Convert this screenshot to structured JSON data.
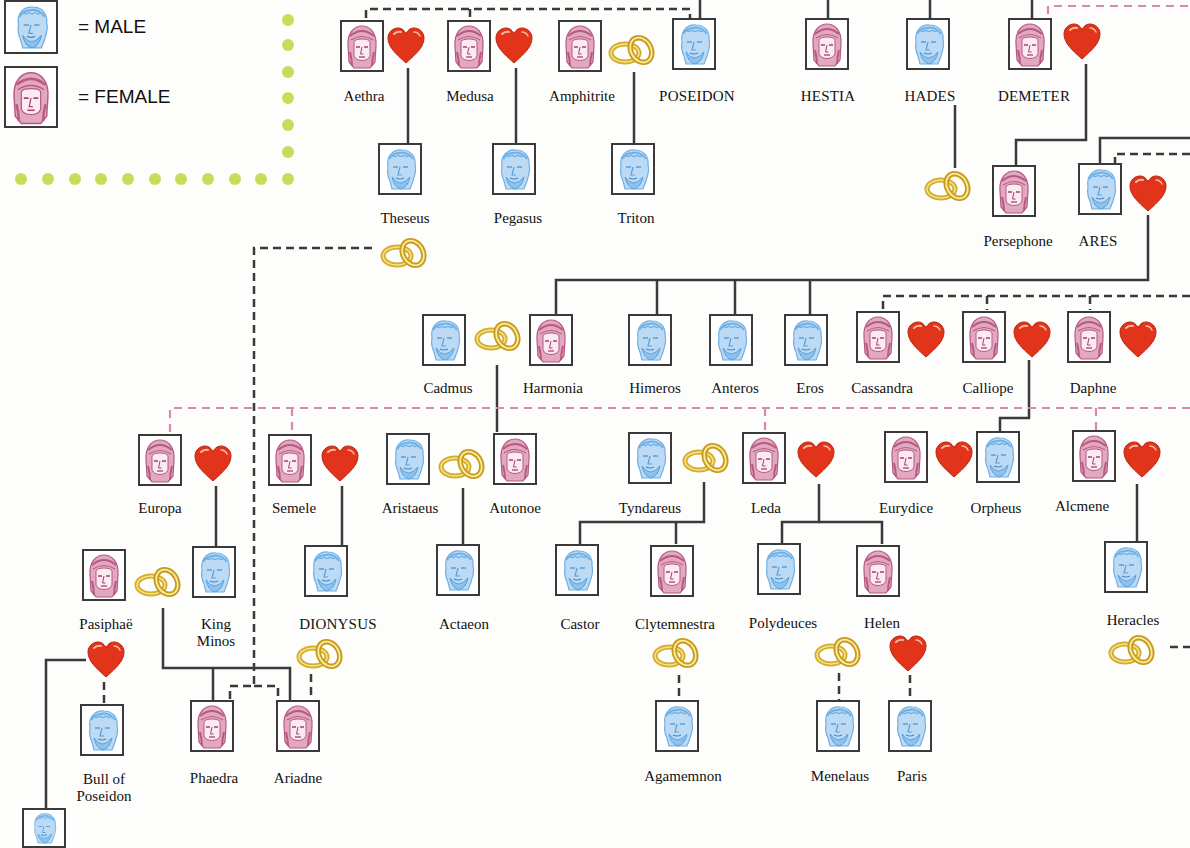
{
  "legend": {
    "male_label": "= MALE",
    "female_label": "= FEMALE",
    "male_color": "#7ab8ea",
    "female_color": "#c0648a",
    "border_color": "#c8dc5a"
  },
  "symbols": {
    "heart": "heart-icon (love affair)",
    "rings": "wedding-rings-icon (marriage)",
    "heart_color": "#e23a1c",
    "ring_color": "#d9b63a"
  },
  "people": [
    {
      "id": "aethra",
      "name": "Aethra",
      "sex": "female"
    },
    {
      "id": "medusa",
      "name": "Medusa",
      "sex": "female"
    },
    {
      "id": "amphitrite",
      "name": "Amphitrite",
      "sex": "female"
    },
    {
      "id": "poseidon",
      "name": "POSEIDON",
      "sex": "male"
    },
    {
      "id": "hestia",
      "name": "HESTIA",
      "sex": "female"
    },
    {
      "id": "hades",
      "name": "HADES",
      "sex": "male"
    },
    {
      "id": "demeter",
      "name": "DEMETER",
      "sex": "female"
    },
    {
      "id": "theseus",
      "name": "Theseus",
      "sex": "male"
    },
    {
      "id": "pegasus",
      "name": "Pegasus",
      "sex": "male"
    },
    {
      "id": "triton",
      "name": "Triton",
      "sex": "male"
    },
    {
      "id": "persephone",
      "name": "Persephone",
      "sex": "female"
    },
    {
      "id": "ares",
      "name": "ARES",
      "sex": "male"
    },
    {
      "id": "cadmus",
      "name": "Cadmus",
      "sex": "male"
    },
    {
      "id": "harmonia",
      "name": "Harmonia",
      "sex": "female"
    },
    {
      "id": "himeros",
      "name": "Himeros",
      "sex": "male"
    },
    {
      "id": "anteros",
      "name": "Anteros",
      "sex": "male"
    },
    {
      "id": "eros",
      "name": "Eros",
      "sex": "male"
    },
    {
      "id": "cassandra",
      "name": "Cassandra",
      "sex": "female"
    },
    {
      "id": "calliope",
      "name": "Calliope",
      "sex": "female"
    },
    {
      "id": "daphne",
      "name": "Daphne",
      "sex": "female"
    },
    {
      "id": "europa",
      "name": "Europa",
      "sex": "female"
    },
    {
      "id": "semele",
      "name": "Semele",
      "sex": "female"
    },
    {
      "id": "aristaeus",
      "name": "Aristaeus",
      "sex": "male"
    },
    {
      "id": "autonoe",
      "name": "Autonoe",
      "sex": "female"
    },
    {
      "id": "tyndareus",
      "name": "Tyndareus",
      "sex": "male"
    },
    {
      "id": "leda",
      "name": "Leda",
      "sex": "female"
    },
    {
      "id": "eurydice",
      "name": "Eurydice",
      "sex": "female"
    },
    {
      "id": "orpheus",
      "name": "Orpheus",
      "sex": "male"
    },
    {
      "id": "alcmene",
      "name": "Alcmene",
      "sex": "female"
    },
    {
      "id": "pasiphae",
      "name": "Pasiphaë",
      "sex": "female"
    },
    {
      "id": "minos",
      "name": "King Minos",
      "sex": "male"
    },
    {
      "id": "dionysus",
      "name": "DIONYSUS",
      "sex": "male"
    },
    {
      "id": "actaeon",
      "name": "Actaeon",
      "sex": "male"
    },
    {
      "id": "castor",
      "name": "Castor",
      "sex": "male"
    },
    {
      "id": "clytemnestra",
      "name": "Clytemnestra",
      "sex": "female"
    },
    {
      "id": "polydeuces",
      "name": "Polydeuces",
      "sex": "male"
    },
    {
      "id": "helen",
      "name": "Helen",
      "sex": "female"
    },
    {
      "id": "heracles",
      "name": "Heracles",
      "sex": "male"
    },
    {
      "id": "bull",
      "name": "Bull of Poseidon",
      "sex": "male"
    },
    {
      "id": "phaedra",
      "name": "Phaedra",
      "sex": "female"
    },
    {
      "id": "ariadne",
      "name": "Ariadne",
      "sex": "female"
    },
    {
      "id": "agamemnon",
      "name": "Agamemnon",
      "sex": "male"
    },
    {
      "id": "menelaus",
      "name": "Menelaus",
      "sex": "male"
    },
    {
      "id": "paris",
      "name": "Paris",
      "sex": "male"
    }
  ],
  "labels": {
    "aethra": "Aethra",
    "medusa": "Medusa",
    "amphitrite": "Amphitrite",
    "poseidon": "POSEIDON",
    "hestia": "HESTIA",
    "hades": "HADES",
    "demeter": "DEMETER",
    "theseus": "Theseus",
    "pegasus": "Pegasus",
    "triton": "Triton",
    "persephone": "Persephone",
    "ares": "ARES",
    "cadmus": "Cadmus",
    "harmonia": "Harmonia",
    "himeros": "Himeros",
    "anteros": "Anteros",
    "eros": "Eros",
    "cassandra": "Cassandra",
    "calliope": "Calliope",
    "daphne": "Daphne",
    "europa": "Europa",
    "semele": "Semele",
    "aristaeus": "Aristaeus",
    "autonoe": "Autonoe",
    "tyndareus": "Tyndareus",
    "leda": "Leda",
    "eurydice": "Eurydice",
    "orpheus": "Orpheus",
    "alcmene": "Alcmene",
    "pasiphae": "Pasiphaë",
    "minos_1": "King",
    "minos_2": "Minos",
    "dionysus": "DIONYSUS",
    "actaeon": "Actaeon",
    "castor": "Castor",
    "clytemnestra": "Clytemnestra",
    "polydeuces": "Polydeuces",
    "helen": "Helen",
    "heracles": "Heracles",
    "bull_1": "Bull of",
    "bull_2": "Poseidon",
    "phaedra": "Phaedra",
    "ariadne": "Ariadne",
    "agamemnon": "Agamemnon",
    "menelaus": "Menelaus",
    "paris": "Paris"
  }
}
